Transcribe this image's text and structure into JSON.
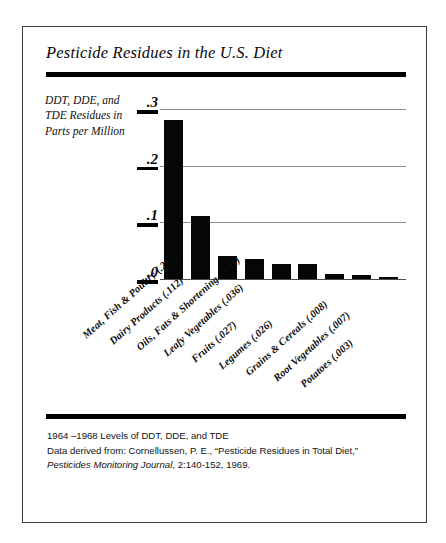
{
  "figure": {
    "title": "Pesticide Residues in the U.S. Diet",
    "y_axis_caption": "DDT, DDE, and TDE Residues in Parts per Million",
    "footnote": {
      "line1": "1964 –1968 Levels of DDT, DDE, and TDE",
      "line2": "Data derived from: Cornellussen, P. E., “Pesticide Residues in Total Diet,”",
      "line3_italic": "Pesticides Monitoring Journal",
      "line3_rest": ", 2:140-152, 1969."
    },
    "colors": {
      "bar": "#060606",
      "rule": "#000000",
      "gridline": "#8d8d8d",
      "frame": "#3b3b3b",
      "background": "#ffffff"
    }
  },
  "chart_data": {
    "type": "bar",
    "title": "Pesticide Residues in the U.S. Diet",
    "xlabel": "",
    "ylabel": "DDT, DDE, and TDE Residues in Parts per Million",
    "ylim": [
      0,
      0.3
    ],
    "yticks": [
      0,
      0.1,
      0.2,
      0.3
    ],
    "ytick_labels": [
      ".0",
      ".1",
      ".2",
      ".3"
    ],
    "grid": true,
    "legend": "none",
    "categories": [
      "Meat, Fish & Poultry",
      "Dairy Products",
      "Oils, Fats & Shortening",
      "Leafy Vegetables",
      "Fruits",
      "Legumes",
      "Grains & Cereals",
      "Root Vegetables",
      "Potatoes"
    ],
    "values": [
      0.281,
      0.112,
      0.041,
      0.036,
      0.027,
      0.026,
      0.008,
      0.007,
      0.003
    ],
    "value_labels": [
      ".281",
      ".112",
      ".041",
      ".036",
      ".027",
      ".026",
      ".008",
      ".007",
      ".003"
    ],
    "category_labels": [
      "Meat, Fish & Poultry (.281)",
      "Dairy Products (.112)",
      "Oils, Fats & Shortening (.041)",
      "Leafy Vegetables (.036)",
      "Fruits (.027)",
      "Legumes (.026)",
      "Grains & Cereals (.008)",
      "Root Vegetables (.007)",
      "Potatoes (.003)"
    ],
    "units": "parts per million",
    "source": "Cornellussen, P. E., “Pesticide Residues in Total Diet,” Pesticides Monitoring Journal, 2:140-152, 1969.",
    "period": "1964–1968"
  }
}
